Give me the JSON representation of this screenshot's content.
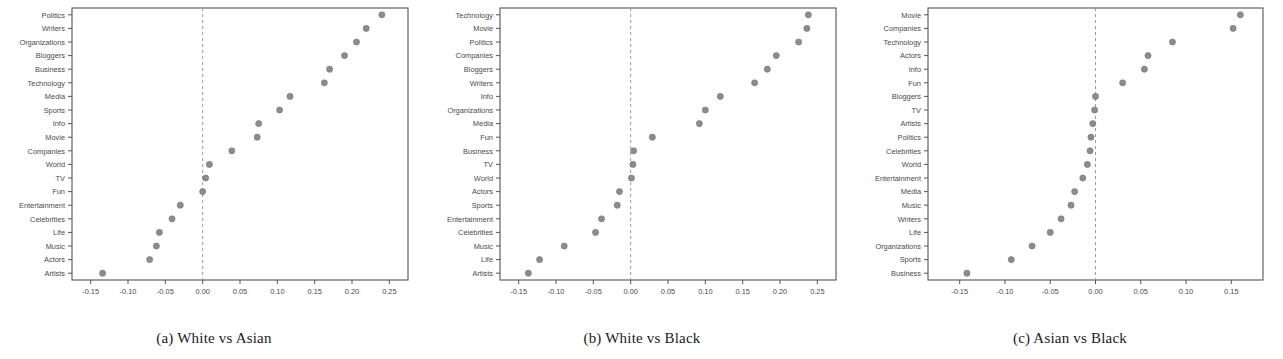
{
  "figure": {
    "background_color": "#ffffff",
    "dot_color": "#8c8c8c",
    "axis_color": "#555555",
    "zeroline_color": "#9a9a9a"
  },
  "panels": [
    {
      "id": "panel-a",
      "caption": "(a) White vs Asian",
      "chart_data": {
        "type": "scatter",
        "title": "",
        "xlabel": "log(White/Asian)",
        "ylabel": "",
        "xlim": [
          -0.175,
          0.275
        ],
        "ylim": [
          0,
          21
        ],
        "grid": false,
        "legend": "none",
        "xticks": [
          "-0.15",
          "-0.10",
          "-0.05",
          "0.00",
          "0.05",
          "0.10",
          "0.15",
          "0.20",
          "0.25"
        ],
        "xtick_values": [
          -0.15,
          -0.1,
          -0.05,
          0.0,
          0.05,
          0.1,
          0.15,
          0.2,
          0.25
        ],
        "reference_line": 0.0,
        "categories": [
          "Politics",
          "Writers",
          "Organizations",
          "Bloggers",
          "Business",
          "Technology",
          "Media",
          "Sports",
          "Info",
          "Movie",
          "Companies",
          "World",
          "TV",
          "Fun",
          "Entertainment",
          "Celebrities",
          "Life",
          "Music",
          "Actors",
          "Artists"
        ],
        "values": [
          0.24,
          0.219,
          0.206,
          0.19,
          0.17,
          0.163,
          0.117,
          0.103,
          0.075,
          0.073,
          0.039,
          0.009,
          0.004,
          0.0,
          -0.03,
          -0.041,
          -0.058,
          -0.062,
          -0.071,
          -0.134
        ]
      }
    },
    {
      "id": "panel-b",
      "caption": "(b) White vs Black",
      "chart_data": {
        "type": "scatter",
        "title": "",
        "xlabel": "log(White/Black)",
        "ylabel": "",
        "xlim": [
          -0.175,
          0.275
        ],
        "ylim": [
          0,
          21
        ],
        "grid": false,
        "legend": "none",
        "xticks": [
          "-0.15",
          "-0.10",
          "-0.05",
          "0.00",
          "0.05",
          "0.10",
          "0.15",
          "0.20",
          "0.25"
        ],
        "xtick_values": [
          -0.15,
          -0.1,
          -0.05,
          0.0,
          0.05,
          0.1,
          0.15,
          0.2,
          0.25
        ],
        "reference_line": 0.0,
        "categories": [
          "Technology",
          "Movie",
          "Politics",
          "Companies",
          "Bloggers",
          "Writers",
          "Info",
          "Organizations",
          "Media",
          "Fun",
          "Business",
          "TV",
          "World",
          "Actors",
          "Sports",
          "Entertainment",
          "Celebrities",
          "Music",
          "Life",
          "Artists"
        ],
        "values": [
          0.238,
          0.236,
          0.225,
          0.195,
          0.183,
          0.166,
          0.12,
          0.1,
          0.092,
          0.029,
          0.004,
          0.003,
          0.001,
          -0.015,
          -0.018,
          -0.039,
          -0.047,
          -0.089,
          -0.122,
          -0.137
        ]
      }
    },
    {
      "id": "panel-c",
      "caption": "(c) Asian vs Black",
      "chart_data": {
        "type": "scatter",
        "title": "",
        "xlabel": "log(Asian/Black)",
        "ylabel": "",
        "xlim": [
          -0.185,
          0.185
        ],
        "ylim": [
          0,
          21
        ],
        "grid": false,
        "legend": "none",
        "xticks": [
          "-0.15",
          "-0.10",
          "-0.05",
          "0.00",
          "0.05",
          "0.10",
          "0.15"
        ],
        "xtick_values": [
          -0.15,
          -0.1,
          -0.05,
          0.0,
          0.05,
          0.1,
          0.15
        ],
        "reference_line": 0.0,
        "categories": [
          "Movie",
          "Companies",
          "Technology",
          "Actors",
          "Info",
          "Fun",
          "Bloggers",
          "TV",
          "Artists",
          "Politics",
          "Celebrities",
          "World",
          "Entertainment",
          "Media",
          "Music",
          "Writers",
          "Life",
          "Organizations",
          "Sports",
          "Business"
        ],
        "values": [
          0.16,
          0.152,
          0.085,
          0.058,
          0.054,
          0.03,
          0.0,
          -0.001,
          -0.003,
          -0.005,
          -0.006,
          -0.009,
          -0.014,
          -0.023,
          -0.027,
          -0.038,
          -0.05,
          -0.07,
          -0.093,
          -0.142
        ]
      }
    }
  ]
}
